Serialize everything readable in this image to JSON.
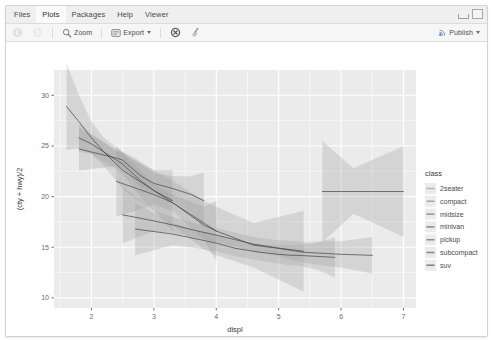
{
  "window": {
    "tabs": [
      {
        "label": "Files",
        "active": false
      },
      {
        "label": "Plots",
        "active": true
      },
      {
        "label": "Packages",
        "active": false
      },
      {
        "label": "Help",
        "active": false
      },
      {
        "label": "Viewer",
        "active": false
      }
    ],
    "controls": {
      "minimize": "minimize-window",
      "maximize": "maximize-window"
    }
  },
  "toolbar": {
    "back_label": "",
    "forward_label": "",
    "zoom_label": "Zoom",
    "export_label": "Export",
    "remove_label": "",
    "clear_label": "",
    "publish_label": "Publish"
  },
  "chart_data": {
    "type": "line",
    "title": "",
    "xlabel": "displ",
    "ylabel": "(cty + hwy)/2",
    "xlim": [
      1.4,
      7.2
    ],
    "ylim": [
      9.0,
      32.5
    ],
    "xticks": [
      "2",
      "3",
      "4",
      "5",
      "6",
      "7"
    ],
    "xtick_values": [
      2,
      3,
      4,
      5,
      6,
      7
    ],
    "yticks": [
      "10",
      "15",
      "20",
      "25",
      "30"
    ],
    "ytick_values": [
      10,
      15,
      20,
      25,
      30
    ],
    "grid": true,
    "legend_position": "right",
    "legend_title": "class",
    "panel_background": "#ebebeb",
    "grid_color": "#ffffff",
    "ribbon_color": "#9a9a9a",
    "ribbon_opacity": 0.28,
    "line_color": "#4d4d4d",
    "series": [
      {
        "name": "2seater",
        "legend_swatch": "#b4b4b4",
        "x": [
          5.7,
          6.2,
          7.0
        ],
        "values": [
          20.5,
          20.5,
          20.5
        ],
        "lower": [
          15.5,
          18.3,
          16.0
        ],
        "upper": [
          25.5,
          22.8,
          25.0
        ]
      },
      {
        "name": "compact",
        "legend_swatch": "#a6a6a6",
        "x": [
          1.8,
          2.0,
          2.2,
          2.4,
          2.5,
          2.8,
          3.0,
          3.3
        ],
        "values": [
          25.8,
          25.2,
          24.4,
          23.6,
          23.2,
          21.5,
          20.6,
          19.6
        ],
        "lower": [
          24.4,
          24.2,
          23.4,
          22.7,
          22.2,
          19.8,
          18.6,
          16.6
        ],
        "upper": [
          27.2,
          26.2,
          25.4,
          24.5,
          24.2,
          23.2,
          22.6,
          22.6
        ]
      },
      {
        "name": "midsize",
        "legend_swatch": "#9e9e9e",
        "x": [
          1.8,
          2.4,
          2.5,
          2.8,
          3.0,
          3.3,
          3.5,
          3.6,
          3.8
        ],
        "values": [
          24.7,
          23.8,
          23.6,
          22.0,
          21.3,
          20.8,
          20.4,
          20.2,
          19.6
        ],
        "lower": [
          22.6,
          23.0,
          22.8,
          20.8,
          20.3,
          19.6,
          18.8,
          18.4,
          16.8
        ],
        "upper": [
          26.8,
          24.6,
          24.4,
          23.2,
          22.3,
          22.0,
          22.0,
          22.0,
          22.4
        ]
      },
      {
        "name": "minivan",
        "legend_swatch": "#969696",
        "x": [
          2.4,
          3.0,
          3.3,
          3.8,
          4.0
        ],
        "values": [
          21.5,
          20.2,
          19.4,
          17.4,
          16.6
        ],
        "lower": [
          18.0,
          19.2,
          18.6,
          15.8,
          13.6
        ],
        "upper": [
          25.0,
          21.2,
          20.2,
          19.0,
          19.6
        ]
      },
      {
        "name": "pickup",
        "legend_swatch": "#8e8e8e",
        "x": [
          2.7,
          3.3,
          3.7,
          4.0,
          4.3,
          4.6,
          4.7,
          5.0,
          5.2,
          5.3,
          5.6,
          5.9
        ],
        "values": [
          16.8,
          16.3,
          15.8,
          15.4,
          14.9,
          14.6,
          14.5,
          14.3,
          14.2,
          14.2,
          14.1,
          14.0
        ],
        "lower": [
          14.2,
          15.2,
          14.9,
          14.6,
          14.1,
          13.8,
          13.7,
          13.4,
          13.2,
          13.2,
          12.8,
          12.0
        ],
        "upper": [
          19.4,
          17.4,
          16.7,
          16.2,
          15.7,
          15.4,
          15.3,
          15.2,
          15.2,
          15.2,
          15.4,
          16.0
        ]
      },
      {
        "name": "subcompact",
        "legend_swatch": "#868686",
        "x": [
          1.6,
          1.8,
          2.0,
          2.2,
          2.5,
          2.7,
          3.0,
          3.3,
          3.8,
          4.0,
          4.6,
          5.4
        ],
        "values": [
          28.9,
          27.4,
          25.8,
          24.4,
          22.6,
          21.8,
          20.6,
          19.4,
          17.2,
          16.6,
          15.2,
          14.6
        ],
        "lower": [
          24.6,
          24.8,
          24.2,
          23.0,
          20.8,
          19.8,
          18.6,
          17.2,
          14.8,
          14.2,
          13.0,
          10.6
        ],
        "upper": [
          33.2,
          30.0,
          27.4,
          25.8,
          24.4,
          23.8,
          22.6,
          21.6,
          19.6,
          19.0,
          17.4,
          18.6
        ]
      },
      {
        "name": "suv",
        "legend_swatch": "#7e7e7e",
        "x": [
          2.5,
          3.0,
          3.3,
          3.7,
          4.0,
          4.2,
          4.4,
          4.6,
          4.7,
          5.0,
          5.3,
          5.4,
          5.7,
          6.0,
          6.5
        ],
        "values": [
          18.2,
          17.6,
          17.2,
          16.6,
          16.2,
          15.9,
          15.6,
          15.3,
          15.2,
          14.9,
          14.6,
          14.5,
          14.4,
          14.3,
          14.2
        ],
        "lower": [
          15.4,
          16.6,
          16.4,
          15.9,
          15.5,
          15.2,
          14.9,
          14.6,
          14.5,
          14.1,
          13.6,
          13.5,
          13.2,
          13.0,
          12.4
        ],
        "upper": [
          21.0,
          18.6,
          18.0,
          17.3,
          16.9,
          16.6,
          16.3,
          16.0,
          15.9,
          15.7,
          15.6,
          15.5,
          15.6,
          15.6,
          16.0
        ]
      }
    ]
  }
}
